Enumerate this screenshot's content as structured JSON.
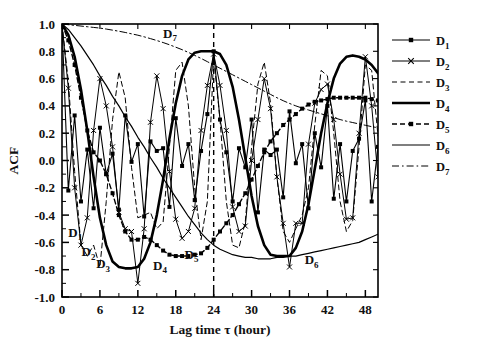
{
  "chart_data": {
    "type": "line",
    "title": "",
    "xlabel": "Lag time τ (hour)",
    "ylabel": "ACF",
    "xlim": [
      0,
      50
    ],
    "ylim": [
      -1.0,
      1.0
    ],
    "grid": false,
    "legend_position": "right",
    "x_ticks": [
      0,
      6,
      12,
      18,
      24,
      30,
      36,
      42,
      48
    ],
    "x_tick_labels": [
      "0",
      "6",
      "12",
      "18",
      "24",
      "30",
      "36",
      "42",
      "48"
    ],
    "x_minor_step": 3,
    "y_ticks": [
      -1.0,
      -0.8,
      -0.6,
      -0.4,
      -0.2,
      0.0,
      0.2,
      0.4,
      0.6,
      0.8,
      1.0
    ],
    "y_tick_labels": [
      "-1.0",
      "-0.8",
      "-0.6",
      "-0.4",
      "-0.2",
      "0.0",
      "0.2",
      "0.4",
      "0.6",
      "0.8",
      "1.0"
    ],
    "y_minor_step": 0.1,
    "annotations": [
      {
        "text": "D",
        "sub": "1",
        "x": 1.0,
        "y": -0.56
      },
      {
        "text": "D",
        "sub": "2",
        "x": 3.1,
        "y": -0.7
      },
      {
        "text": "D",
        "sub": "3",
        "x": 5.4,
        "y": -0.79
      },
      {
        "text": "D",
        "sub": "4",
        "x": 14.4,
        "y": -0.8
      },
      {
        "text": "D",
        "sub": "5",
        "x": 19.4,
        "y": -0.72
      },
      {
        "text": "D",
        "sub": "6",
        "x": 38.4,
        "y": -0.76
      },
      {
        "text": "D",
        "sub": "7",
        "x": 16.0,
        "y": 0.9
      }
    ],
    "reference_line": {
      "x": 24,
      "style": "dashed",
      "label": ""
    },
    "series": [
      {
        "name": "D1",
        "style": "solid-marker",
        "marker": "square",
        "width": 1.1,
        "x": [
          0,
          1,
          2,
          3,
          4,
          5,
          6,
          7,
          8,
          9,
          10,
          11,
          12,
          13,
          14,
          15,
          16,
          17,
          18,
          19,
          20,
          21,
          22,
          23,
          24,
          25,
          26,
          27,
          28,
          29,
          30,
          31,
          32,
          33,
          34,
          35,
          36,
          37,
          38,
          39,
          40,
          41,
          42,
          43,
          44,
          45,
          46,
          47,
          48,
          49,
          50
        ],
        "y": [
          1.0,
          -0.22,
          0.33,
          -0.3,
          0.08,
          -0.35,
          0.24,
          -0.1,
          0.05,
          -0.36,
          0.33,
          -0.01,
          0.12,
          -0.41,
          0.14,
          0.07,
          0.09,
          -0.34,
          0.31,
          -0.04,
          0.12,
          -0.29,
          0.07,
          0.34,
          0.8,
          0.3,
          0.06,
          -0.3,
          0.09,
          -0.05,
          0.3,
          -0.38,
          0.08,
          0.04,
          0.08,
          -0.27,
          0.36,
          -0.02,
          0.12,
          -0.35,
          0.2,
          -0.05,
          0.4,
          -0.28,
          0.12,
          -0.3,
          0.07,
          0.16,
          0.44,
          -0.3,
          0.1
        ]
      },
      {
        "name": "D2",
        "style": "solid-marker",
        "marker": "x",
        "width": 1.0,
        "x": [
          0,
          1,
          2,
          3,
          4,
          5,
          6,
          7,
          8,
          9,
          10,
          11,
          12,
          13,
          14,
          15,
          16,
          17,
          18,
          19,
          20,
          21,
          22,
          23,
          24,
          25,
          26,
          27,
          28,
          29,
          30,
          31,
          32,
          33,
          34,
          35,
          36,
          37,
          38,
          39,
          40,
          41,
          42,
          43,
          44,
          45,
          46,
          47,
          48,
          49,
          50
        ],
        "y": [
          1.0,
          0.53,
          -0.2,
          -0.62,
          -0.42,
          0.22,
          0.6,
          0.4,
          0.1,
          -0.38,
          -0.5,
          -0.52,
          -0.9,
          -0.5,
          0.28,
          0.62,
          0.38,
          -0.08,
          -0.43,
          -0.57,
          -0.52,
          -0.35,
          0.22,
          0.55,
          0.78,
          0.55,
          0.22,
          -0.34,
          -0.52,
          -0.48,
          0.0,
          0.3,
          0.6,
          0.38,
          -0.12,
          -0.46,
          -0.78,
          -0.46,
          -0.46,
          0.12,
          0.42,
          0.52,
          0.56,
          0.3,
          -0.1,
          -0.43,
          -0.42,
          0.2,
          0.76,
          0.4,
          -0.12
        ]
      },
      {
        "name": "D3",
        "style": "dashed",
        "marker": "none",
        "width": 1.0,
        "x": [
          0,
          1,
          2,
          3,
          4,
          5,
          6,
          7,
          8,
          9,
          10,
          11,
          12,
          13,
          14,
          15,
          16,
          17,
          18,
          19,
          20,
          21,
          22,
          23,
          24,
          25,
          26,
          27,
          28,
          29,
          30,
          31,
          32,
          33,
          34,
          35,
          36,
          37,
          38,
          39,
          40,
          41,
          42,
          43,
          44,
          45,
          46,
          47,
          48,
          49,
          50
        ],
        "y": [
          1.0,
          0.58,
          -0.08,
          -0.62,
          -0.7,
          -0.62,
          -0.78,
          -0.3,
          0.3,
          0.65,
          0.46,
          -0.05,
          -0.42,
          -0.4,
          -0.38,
          -0.5,
          -0.45,
          0.1,
          0.66,
          0.72,
          0.4,
          -0.2,
          -0.58,
          -0.3,
          0.76,
          0.3,
          -0.3,
          -0.62,
          -0.64,
          -0.45,
          0.1,
          0.56,
          0.72,
          0.42,
          -0.12,
          -0.52,
          -0.6,
          -0.5,
          -0.4,
          -0.2,
          0.26,
          0.66,
          0.62,
          0.2,
          -0.3,
          -0.52,
          -0.44,
          0.1,
          0.7,
          0.66,
          0.18
        ]
      },
      {
        "name": "D4",
        "style": "solid",
        "marker": "none",
        "width": 2.6,
        "x": [
          0,
          1,
          2,
          3,
          4,
          5,
          6,
          7,
          8,
          9,
          10,
          11,
          12,
          13,
          14,
          15,
          16,
          17,
          18,
          19,
          20,
          21,
          22,
          23,
          24,
          25,
          26,
          27,
          28,
          29,
          30,
          31,
          32,
          33,
          34,
          35,
          36,
          37,
          38,
          39,
          40,
          41,
          42,
          43,
          44,
          45,
          46,
          47,
          48,
          49,
          50
        ],
        "y": [
          1.0,
          0.92,
          0.76,
          0.52,
          0.22,
          -0.12,
          -0.42,
          -0.62,
          -0.74,
          -0.78,
          -0.79,
          -0.79,
          -0.78,
          -0.72,
          -0.6,
          -0.4,
          -0.14,
          0.16,
          0.42,
          0.62,
          0.74,
          0.79,
          0.8,
          0.8,
          0.8,
          0.78,
          0.7,
          0.54,
          0.3,
          0.02,
          -0.26,
          -0.48,
          -0.62,
          -0.69,
          -0.7,
          -0.7,
          -0.7,
          -0.64,
          -0.52,
          -0.32,
          -0.06,
          0.2,
          0.42,
          0.6,
          0.71,
          0.76,
          0.77,
          0.76,
          0.74,
          0.7,
          0.64
        ]
      },
      {
        "name": "D5",
        "style": "dashed-marker",
        "marker": "square",
        "width": 1.4,
        "x": [
          0,
          1,
          2,
          3,
          4,
          5,
          6,
          7,
          8,
          9,
          10,
          11,
          12,
          13,
          14,
          15,
          16,
          17,
          18,
          19,
          20,
          21,
          22,
          23,
          24,
          25,
          26,
          27,
          28,
          29,
          30,
          31,
          32,
          33,
          34,
          35,
          36,
          37,
          38,
          39,
          40,
          41,
          42,
          43,
          44,
          45,
          46,
          47,
          48,
          49,
          50
        ],
        "y": [
          1.0,
          0.88,
          0.7,
          0.46,
          0.22,
          0.06,
          0.0,
          -0.1,
          -0.24,
          -0.4,
          -0.52,
          -0.58,
          -0.58,
          -0.56,
          -0.58,
          -0.62,
          -0.66,
          -0.69,
          -0.7,
          -0.7,
          -0.7,
          -0.69,
          -0.68,
          -0.64,
          -0.58,
          -0.52,
          -0.46,
          -0.4,
          -0.32,
          -0.24,
          -0.14,
          -0.04,
          0.06,
          0.14,
          0.2,
          0.26,
          0.3,
          0.34,
          0.38,
          0.41,
          0.43,
          0.44,
          0.45,
          0.46,
          0.46,
          0.46,
          0.46,
          0.46,
          0.46,
          0.45,
          0.44
        ]
      },
      {
        "name": "D6",
        "style": "solid",
        "marker": "none",
        "width": 1.2,
        "x": [
          0,
          1,
          2,
          3,
          4,
          5,
          6,
          7,
          8,
          9,
          10,
          11,
          12,
          13,
          14,
          15,
          16,
          17,
          18,
          19,
          20,
          21,
          22,
          23,
          24,
          25,
          26,
          27,
          28,
          29,
          30,
          31,
          32,
          33,
          34,
          35,
          36,
          37,
          38,
          39,
          40,
          41,
          42,
          43,
          44,
          45,
          46,
          47,
          48,
          49,
          50
        ],
        "y": [
          1.0,
          0.96,
          0.9,
          0.84,
          0.77,
          0.7,
          0.62,
          0.55,
          0.47,
          0.4,
          0.32,
          0.25,
          0.17,
          0.1,
          0.02,
          -0.05,
          -0.13,
          -0.2,
          -0.27,
          -0.34,
          -0.41,
          -0.47,
          -0.53,
          -0.58,
          -0.62,
          -0.65,
          -0.67,
          -0.69,
          -0.7,
          -0.71,
          -0.71,
          -0.72,
          -0.72,
          -0.72,
          -0.71,
          -0.71,
          -0.7,
          -0.7,
          -0.69,
          -0.68,
          -0.67,
          -0.66,
          -0.65,
          -0.64,
          -0.63,
          -0.62,
          -0.61,
          -0.6,
          -0.58,
          -0.56,
          -0.54
        ]
      },
      {
        "name": "D7",
        "style": "dashdot",
        "marker": "none",
        "width": 1.0,
        "x": [
          0,
          1,
          2,
          3,
          4,
          5,
          6,
          7,
          8,
          9,
          10,
          11,
          12,
          13,
          14,
          15,
          16,
          17,
          18,
          19,
          20,
          21,
          22,
          23,
          24,
          25,
          26,
          27,
          28,
          29,
          30,
          31,
          32,
          33,
          34,
          35,
          36,
          37,
          38,
          39,
          40,
          41,
          42,
          43,
          44,
          45,
          46,
          47,
          48,
          49,
          50
        ],
        "y": [
          1.0,
          0.995,
          0.99,
          0.985,
          0.98,
          0.975,
          0.97,
          0.963,
          0.955,
          0.947,
          0.938,
          0.928,
          0.918,
          0.906,
          0.893,
          0.879,
          0.864,
          0.848,
          0.83,
          0.812,
          0.792,
          0.77,
          0.748,
          0.724,
          0.7,
          0.676,
          0.652,
          0.628,
          0.604,
          0.58,
          0.556,
          0.532,
          0.508,
          0.484,
          0.46,
          0.438,
          0.418,
          0.4,
          0.384,
          0.37,
          0.356,
          0.342,
          0.328,
          0.314,
          0.3,
          0.288,
          0.278,
          0.268,
          0.258,
          0.248,
          0.24
        ]
      }
    ],
    "legend": [
      {
        "label": "D",
        "sub": "1",
        "style": "solid-marker",
        "marker": "square"
      },
      {
        "label": "D",
        "sub": "2",
        "style": "solid-marker",
        "marker": "x"
      },
      {
        "label": "D",
        "sub": "3",
        "style": "dashed",
        "marker": "none"
      },
      {
        "label": "D",
        "sub": "4",
        "style": "solid",
        "marker": "none"
      },
      {
        "label": "D",
        "sub": "5",
        "style": "dashed-marker",
        "marker": "square"
      },
      {
        "label": "D",
        "sub": "6",
        "style": "solid",
        "marker": "none"
      },
      {
        "label": "D",
        "sub": "7",
        "style": "dashdot",
        "marker": "none"
      }
    ],
    "colors": {
      "ink": "#000000",
      "background": "#ffffff"
    }
  }
}
